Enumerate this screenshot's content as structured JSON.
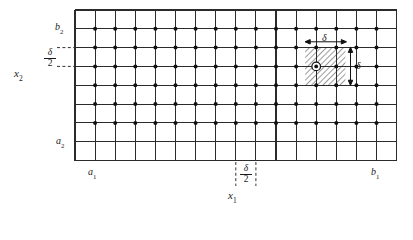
{
  "figure": {
    "type": "finite-difference-grid-diagram",
    "axes": {
      "horizontal_axis_label": "x",
      "horizontal_axis_subscript": "1",
      "vertical_axis_label": "x",
      "vertical_axis_subscript": "2"
    },
    "bounds": {
      "x1_min_label": "a",
      "x1_min_subscript": "1",
      "x1_max_label": "b",
      "x1_max_subscript": "1",
      "x2_min_label": "a",
      "x2_min_subscript": "2",
      "x2_max_label": "b",
      "x2_max_subscript": "2"
    },
    "spacing": {
      "step_symbol": "δ",
      "half_step_numerator": "δ",
      "half_step_denominator": "2",
      "left_half_step_label": "δ/2",
      "bottom_half_step_label": "δ/2",
      "top_dimension_label": "δ",
      "right_dimension_label": "δ"
    },
    "grid": {
      "columns": 16,
      "rows": 8,
      "cell_width": 20.1,
      "cell_height": 18.8,
      "left": 75,
      "top": 10,
      "right": 396.5,
      "bottom": 160.5,
      "line_color": "#2b2b2b",
      "line_width": 1.1
    },
    "nodes": {
      "marker": "filled-circle",
      "radius": 2.0,
      "color": "#111111",
      "first_column_index": 2,
      "last_column_index": 15,
      "first_row_index": 2,
      "last_row_index": 7,
      "count_columns": 14,
      "count_rows": 6
    },
    "highlight": {
      "hatched_cell": {
        "col_start": 12,
        "col_end": 14,
        "row_start": 2,
        "row_end": 4,
        "hatch_color": "#3a3a3a",
        "fill": "none",
        "hatch_angle_deg": 45
      },
      "circled_node": {
        "col": 13,
        "row": 3,
        "outer_radius": 4.2,
        "stroke": "#111111"
      }
    },
    "colors": {
      "background": "#ffffff",
      "ink": "#1a1a1a",
      "grid": "#2b2b2b",
      "dashed": "#333333"
    }
  },
  "labels": {
    "b2": {
      "base": "b",
      "sub": "2"
    },
    "a2": {
      "base": "a",
      "sub": "2"
    },
    "a1": {
      "base": "a",
      "sub": "1"
    },
    "b1": {
      "base": "b",
      "sub": "1"
    },
    "x1": {
      "base": "x",
      "sub": "1"
    },
    "x2": {
      "base": "x",
      "sub": "2"
    },
    "delta_top": "δ",
    "delta_right": "δ",
    "frac_left_num": "δ",
    "frac_left_den": "2",
    "frac_bottom_num": "δ",
    "frac_bottom_den": "2"
  }
}
